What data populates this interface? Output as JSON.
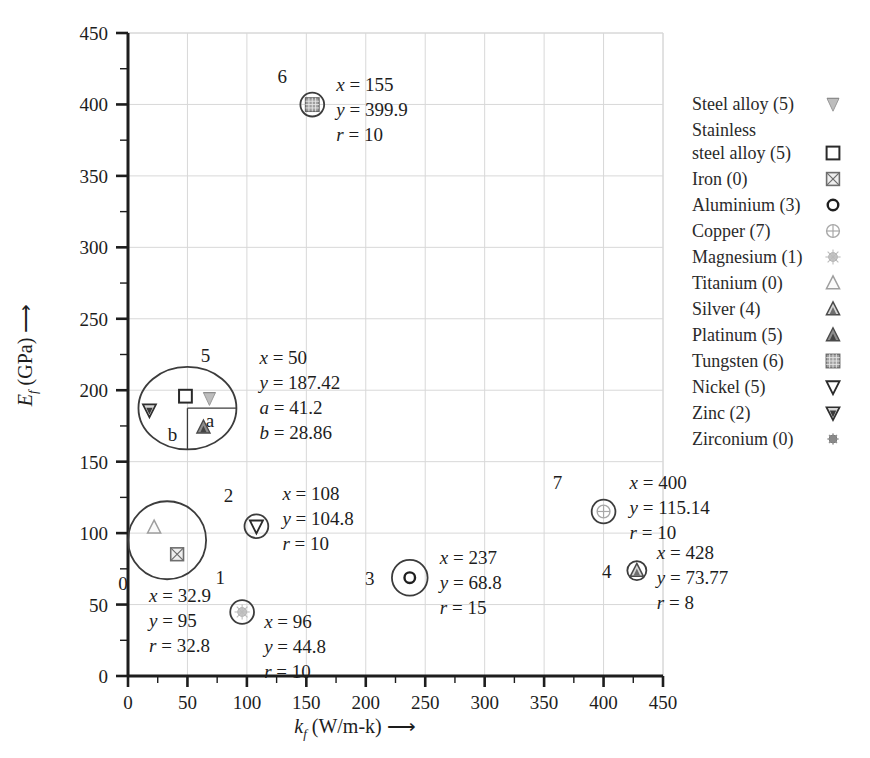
{
  "chart_data": {
    "type": "scatter",
    "title": "",
    "xlabel": "k_f (W/m-k)",
    "ylabel": "E_f (GPa)",
    "xlim": [
      0,
      450
    ],
    "ylim": [
      0,
      450
    ],
    "xticks": [
      0,
      50,
      100,
      150,
      200,
      250,
      300,
      350,
      400,
      450
    ],
    "yticks": [
      0,
      50,
      100,
      150,
      200,
      250,
      300,
      350,
      400,
      450
    ],
    "xtick_labels": [
      "0",
      "50",
      "100",
      "150",
      "200",
      "250",
      "300",
      "350",
      "400",
      "450"
    ],
    "ytick_labels": [
      "0",
      "50",
      "100",
      "150",
      "200",
      "250",
      "300",
      "350",
      "400",
      "450"
    ],
    "grid": true,
    "minor_ticks": true,
    "legend_position": "right",
    "clusters": [
      {
        "id": "0",
        "x": 32.9,
        "y": 95,
        "r": 32.8,
        "shape": "circle",
        "members": [
          "Titanium",
          "Iron"
        ],
        "ann": [
          "x = 32.9",
          "y = 95",
          "r = 32.8"
        ]
      },
      {
        "id": "1",
        "x": 96,
        "y": 44.8,
        "r": 10,
        "shape": "circle",
        "members": [
          "Magnesium"
        ],
        "ann": [
          "x = 96",
          "y = 44.8",
          "r = 10"
        ]
      },
      {
        "id": "2",
        "x": 108,
        "y": 104.8,
        "r": 10,
        "shape": "circle",
        "members": [
          "Nickel"
        ],
        "ann": [
          "x = 108",
          "y = 104.8",
          "r = 10"
        ]
      },
      {
        "id": "3",
        "x": 237,
        "y": 68.8,
        "r": 15,
        "shape": "circle",
        "members": [
          "Aluminium"
        ],
        "ann": [
          "x = 237",
          "y = 68.8",
          "r = 15"
        ]
      },
      {
        "id": "4",
        "x": 428,
        "y": 73.77,
        "r": 8,
        "shape": "circle",
        "members": [
          "Silver"
        ],
        "ann": [
          "x = 428",
          "y = 73.77",
          "r = 8"
        ]
      },
      {
        "id": "5",
        "x": 50,
        "y": 187.42,
        "a": 41.2,
        "b": 28.86,
        "shape": "ellipse",
        "members": [
          "Stainless steel alloy",
          "Steel alloy",
          "Zinc",
          "Platinum"
        ],
        "ann": [
          "x = 50",
          "y = 187.42",
          "a = 41.2",
          "b = 28.86"
        ],
        "axis_labels": {
          "a": "a",
          "b": "b"
        }
      },
      {
        "id": "6",
        "x": 155,
        "y": 399.9,
        "r": 10,
        "shape": "circle",
        "members": [
          "Tungsten"
        ],
        "ann": [
          "x = 155",
          "y = 399.9",
          "r = 10"
        ]
      },
      {
        "id": "7",
        "x": 400,
        "y": 115.14,
        "r": 10,
        "shape": "circle",
        "members": [
          "Copper"
        ],
        "ann": [
          "x = 400",
          "y = 115.14",
          "r = 10"
        ]
      }
    ],
    "legend": [
      {
        "label": "Steel alloy (5)",
        "marker": "steel-alloy-marker"
      },
      {
        "label": "Stainless",
        "label2": "steel alloy (5)",
        "marker": "stainless-steel-alloy-marker"
      },
      {
        "label": "Iron (0)",
        "marker": "iron-marker"
      },
      {
        "label": "Aluminium (3)",
        "marker": "aluminium-marker"
      },
      {
        "label": "Copper (7)",
        "marker": "copper-marker"
      },
      {
        "label": "Magnesium (1)",
        "marker": "magnesium-marker"
      },
      {
        "label": "Titanium (0)",
        "marker": "titanium-marker"
      },
      {
        "label": "Silver (4)",
        "marker": "silver-marker"
      },
      {
        "label": "Platinum (5)",
        "marker": "platinum-marker"
      },
      {
        "label": "Tungsten (6)",
        "marker": "tungsten-marker"
      },
      {
        "label": "Nickel (5)",
        "marker": "nickel-marker"
      },
      {
        "label": "Zinc (2)",
        "marker": "zinc-marker"
      },
      {
        "label": "Zirconium (0)",
        "marker": "zirconium-marker"
      }
    ],
    "colors": {
      "axis": "#1d1d1d",
      "grid": "#d8d8d8",
      "marker": "#6b6b6b",
      "text": "#1d1d1d"
    }
  },
  "axes": {
    "x_title_main": "k",
    "x_title_sub": "f",
    "x_title_unit": "(W/m-k)",
    "y_title_main": "E",
    "y_title_sub": "f",
    "y_title_unit": "(GPa)",
    "arrow": "⟶"
  },
  "legend_title": "",
  "annotations": {
    "cluster_labels": [
      "0",
      "1",
      "2",
      "3",
      "4",
      "5",
      "6",
      "7"
    ]
  }
}
